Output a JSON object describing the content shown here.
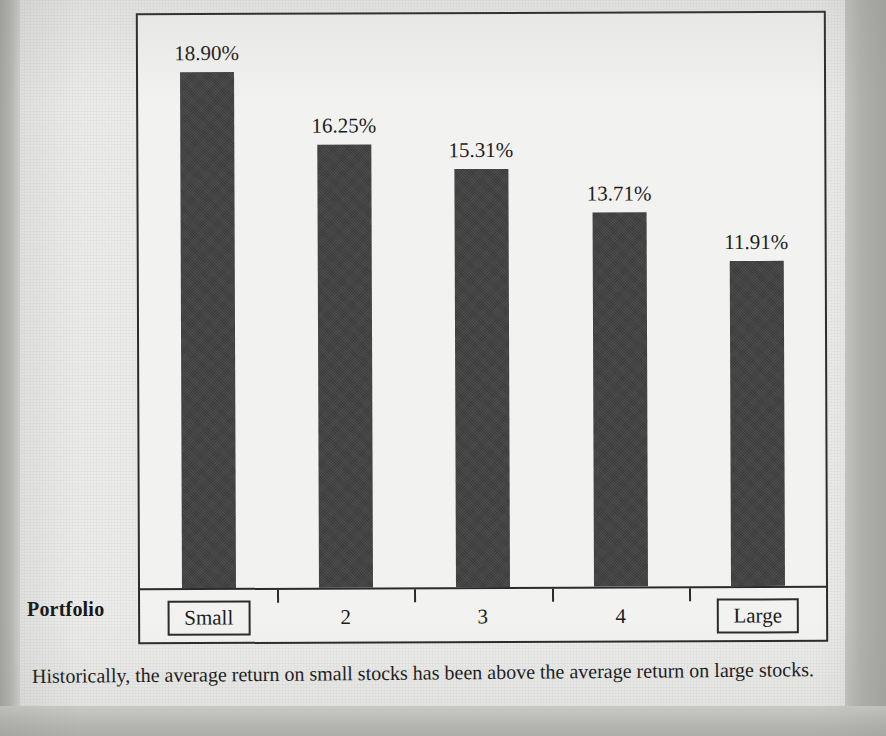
{
  "chart_data": {
    "type": "bar",
    "title": "",
    "xlabel": "Portfolio",
    "ylabel": "",
    "categories": [
      "Small",
      "2",
      "3",
      "4",
      "Large"
    ],
    "values": [
      18.9,
      16.25,
      15.31,
      13.71,
      11.91
    ],
    "value_labels": [
      "18.90%",
      "16.25%",
      "15.31%",
      "13.71%",
      "11.91%"
    ],
    "boxed_categories": [
      "Small",
      "Large"
    ],
    "ylim": [
      0,
      21.0
    ],
    "grid": false,
    "legend": false,
    "bar_color": "#3b3b3b",
    "plot_background": "#f2f2f0",
    "axis_color": "#2b2b2b"
  },
  "axis": {
    "title": "Portfolio"
  },
  "caption": {
    "text": "Historically, the average return on small stocks has been above the average return on large stocks."
  },
  "scan_artifacts": {
    "bleed_lines": [
      "",
      "",
      "",
      "",
      "",
      "",
      ""
    ]
  }
}
